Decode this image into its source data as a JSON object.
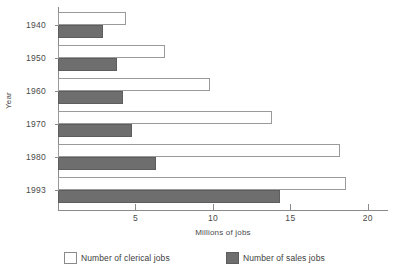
{
  "chart_data": {
    "type": "bar",
    "orientation": "horizontal",
    "title": "",
    "xlabel": "Millions of jobs",
    "ylabel": "Year",
    "categories": [
      "1940",
      "1950",
      "1960",
      "1970",
      "1980",
      "1993"
    ],
    "xlim": [
      0,
      21.3
    ],
    "xticks": [
      5,
      10,
      15,
      20
    ],
    "xtick_labels": [
      "5",
      "10",
      "15",
      "20"
    ],
    "grid": false,
    "legend_position": "bottom",
    "series": [
      {
        "name": "Number of clerical jobs",
        "color": "#ffffff",
        "border_color": "#9a9a9a",
        "values": [
          4.4,
          6.9,
          9.8,
          13.8,
          18.2,
          18.6
        ]
      },
      {
        "name": "Number of sales jobs",
        "color": "#6e6e6e",
        "border_color": "#5d5d5d",
        "values": [
          2.9,
          3.8,
          4.2,
          4.8,
          6.3,
          14.3
        ]
      }
    ]
  },
  "axes": {
    "y_title": "Year",
    "x_title": "Millions of jobs"
  },
  "legend": {
    "items": [
      {
        "label": "Number of clerical jobs",
        "swatch": "clerical"
      },
      {
        "label": "Number of sales jobs",
        "swatch": "sales"
      }
    ]
  },
  "colors": {
    "axis": "#8a8a8a",
    "text": "#3d3d3d",
    "sales_fill": "#6e6e6e",
    "clerical_fill": "#ffffff"
  }
}
